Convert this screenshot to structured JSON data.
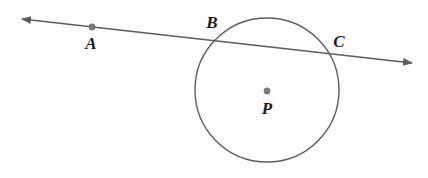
{
  "figure": {
    "background_color": "#fdfdfd",
    "stroke_color": "#5e5e5e",
    "dot_color": "#7a7a7a",
    "label_color": "#1b1b1b",
    "width": 428,
    "height": 178
  },
  "circle": {
    "name": "circle-P",
    "center_x": 267,
    "center_y": 90,
    "radius": 72
  },
  "line": {
    "name": "secant-line-AC",
    "x1": 22,
    "y1": 19,
    "x2": 412,
    "y2": 63,
    "arrow_start": "left-arrowhead",
    "arrow_end": "right-arrowhead"
  },
  "points": [
    {
      "id": "A",
      "label": "A",
      "dot_x": 92,
      "dot_y": 27,
      "label_x": 91,
      "label_y": 43,
      "has_dot": true,
      "role": "point-on-line-outside-circle"
    },
    {
      "id": "B",
      "label": "B",
      "dot_x": 213,
      "dot_y": 40,
      "label_x": 212,
      "label_y": 22,
      "has_dot": false,
      "role": "intersection-left"
    },
    {
      "id": "C",
      "label": "C",
      "dot_x": 333,
      "dot_y": 54,
      "label_x": 339,
      "label_y": 41,
      "has_dot": false,
      "role": "intersection-right"
    },
    {
      "id": "P",
      "label": "P",
      "dot_x": 267,
      "dot_y": 91,
      "label_x": 267,
      "label_y": 108,
      "has_dot": true,
      "role": "circle-center"
    }
  ]
}
